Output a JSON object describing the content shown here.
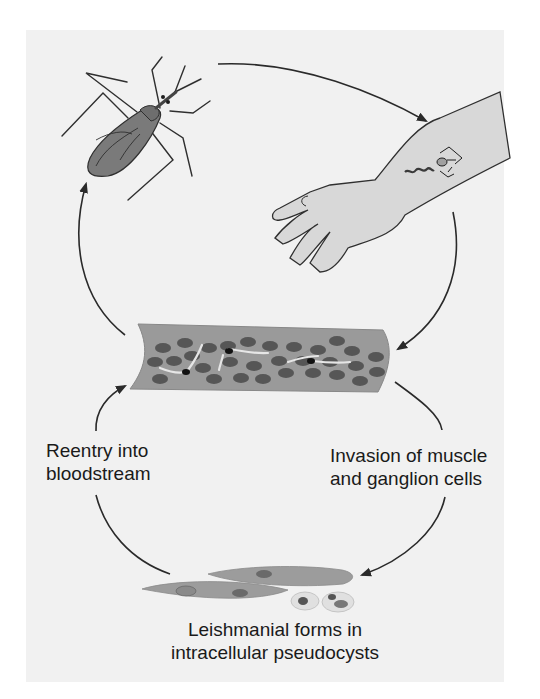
{
  "diagram": {
    "type": "life-cycle",
    "stages": [
      {
        "id": "vector-bug",
        "label": ""
      },
      {
        "id": "bite-on-arm",
        "label": ""
      },
      {
        "id": "bloodstream",
        "label": ""
      },
      {
        "id": "muscle-ganglion-invasion",
        "label_lines": [
          "Invasion of muscle",
          "and ganglion cells"
        ]
      },
      {
        "id": "pseudocysts",
        "label_lines": [
          "Leishmanial forms in",
          "intracellular pseudocysts"
        ]
      },
      {
        "id": "reentry",
        "label_lines": [
          "Reentry into",
          "bloodstream"
        ]
      }
    ],
    "colors": {
      "page": "#ffffff",
      "panel": "#f1f1f1",
      "fill_dark": "#787878",
      "fill_mid": "#9c9c9c",
      "fill_light": "#cfcfcf",
      "rbc": "#565656",
      "line": "#2a2a2a"
    }
  },
  "labels": {
    "reentry": {
      "line1": "Reentry into",
      "line2": "bloodstream"
    },
    "invasion": {
      "line1": "Invasion of muscle",
      "line2": "and ganglion cells"
    },
    "leishmanial": {
      "line1": "Leishmanial forms in",
      "line2": "intracellular pseudocysts"
    }
  }
}
